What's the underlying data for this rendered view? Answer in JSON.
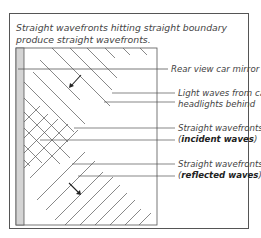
{
  "caption": "Straight wavefronts hitting straight boundary produce straight wavefronts.",
  "labels": {
    "mirror": "Rear view car mirror",
    "light_line1": "Light waves from car",
    "light_line2": "headlights behind",
    "incident_line1": "Straight wavefronts",
    "incident_open": "(",
    "incident_bold": "incident waves",
    "incident_close": ")",
    "reflected_line1": "Straight wavefronts",
    "reflected_open": "(",
    "reflected_bold": "reflected waves",
    "reflected_close": ")"
  },
  "colors": {
    "line": "#555555",
    "mirror_strip": "#d0d0d0",
    "text": "#444444"
  }
}
